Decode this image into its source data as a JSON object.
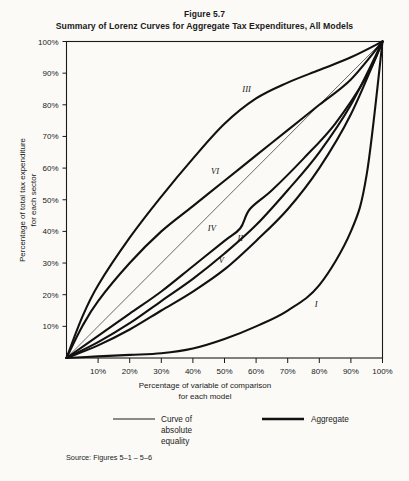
{
  "figure": {
    "number": "Figure 5.7",
    "title": "Summary of Lorenz Curves for Aggregate Tax Expenditures, All Models",
    "source": "Source:  Figures 5–1 – 5–6"
  },
  "legend": {
    "items": [
      {
        "label_line1": "Curve of",
        "label_line2": "absolute",
        "label_line3": "equality",
        "style": "thin"
      },
      {
        "label_line1": "Aggregate",
        "label_line2": "",
        "label_line3": "",
        "style": "thick"
      }
    ]
  },
  "chart_data": {
    "type": "line",
    "title": "Summary of Lorenz Curves for Aggregate Tax Expenditures, All Models",
    "subtitle": "Figure 5.7",
    "xlabel_line1": "Percentage of variable of comparison",
    "xlabel_line2": "for each model",
    "ylabel_line1": "Percentage of total tax expenditure",
    "ylabel_line2": "for each sector",
    "xlim": [
      0,
      100
    ],
    "ylim": [
      0,
      100
    ],
    "grid": false,
    "legend_position": "below-plot",
    "xticks": [
      10,
      20,
      30,
      40,
      50,
      60,
      70,
      80,
      90,
      100
    ],
    "xtick_labels": [
      "10%",
      "20%",
      "30%",
      "40%",
      "50%",
      "60%",
      "70%",
      "80%",
      "90%",
      "100%"
    ],
    "yticks": [
      10,
      20,
      30,
      40,
      50,
      60,
      70,
      80,
      90,
      100
    ],
    "ytick_labels": [
      "10%",
      "20%",
      "30%",
      "40%",
      "50%",
      "60%",
      "70%",
      "80%",
      "90%",
      "100%"
    ],
    "reference_line": {
      "name": "Curve of absolute equality",
      "x": [
        0,
        100
      ],
      "y": [
        0,
        100
      ]
    },
    "series": [
      {
        "name": "I",
        "label": "I",
        "label_x": 79,
        "label_y": 16,
        "x": [
          0,
          10,
          20,
          30,
          40,
          50,
          60,
          70,
          80,
          90,
          95,
          100
        ],
        "y": [
          0,
          0.5,
          1,
          1.5,
          3,
          6,
          10,
          15,
          23,
          40,
          58,
          100
        ]
      },
      {
        "name": "II",
        "label": "II",
        "label_x": 55,
        "label_y": 37,
        "x": [
          0,
          10,
          20,
          30,
          40,
          50,
          60,
          70,
          80,
          90,
          100
        ],
        "y": [
          0,
          5,
          11,
          18,
          25,
          33,
          42,
          53,
          65,
          80,
          100
        ]
      },
      {
        "name": "III",
        "label": "III",
        "label_x": 57,
        "label_y": 84,
        "x": [
          0,
          5,
          10,
          20,
          30,
          40,
          50,
          60,
          70,
          80,
          90,
          100
        ],
        "y": [
          0,
          13,
          23,
          38,
          51,
          63,
          74,
          82,
          87,
          91,
          95,
          100
        ]
      },
      {
        "name": "IV",
        "label": "IV",
        "label_x": 46,
        "label_y": 40,
        "x": [
          0,
          10,
          20,
          30,
          40,
          50,
          55,
          58,
          65,
          75,
          85,
          95,
          100
        ],
        "y": [
          0,
          7,
          14,
          21,
          29,
          37,
          41,
          47,
          53,
          63,
          74,
          89,
          100
        ]
      },
      {
        "name": "V",
        "label": "V",
        "label_x": 49,
        "label_y": 30,
        "x": [
          0,
          10,
          20,
          30,
          40,
          50,
          60,
          70,
          80,
          90,
          100
        ],
        "y": [
          0,
          4,
          9,
          15,
          21,
          28,
          37,
          47,
          60,
          77,
          100
        ]
      },
      {
        "name": "VI",
        "label": "VI",
        "label_x": 47,
        "label_y": 58,
        "x": [
          0,
          5,
          10,
          20,
          30,
          40,
          50,
          60,
          70,
          80,
          90,
          100
        ],
        "y": [
          0,
          10,
          18,
          30,
          40,
          48,
          56,
          64,
          72,
          80,
          88,
          100
        ]
      }
    ]
  }
}
